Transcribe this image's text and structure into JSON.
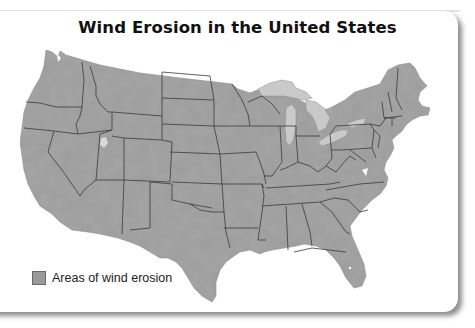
{
  "map": {
    "title": "Wind Erosion in the United States",
    "region": "Contiguous United States",
    "legend": [
      {
        "label": "Areas of wind erosion",
        "color": "#9a9a9a"
      }
    ],
    "colors": {
      "land": "#9c9c9c",
      "lakes": "#c8c8c8",
      "borders": "#3a3a3a",
      "background": "#ffffff"
    }
  }
}
